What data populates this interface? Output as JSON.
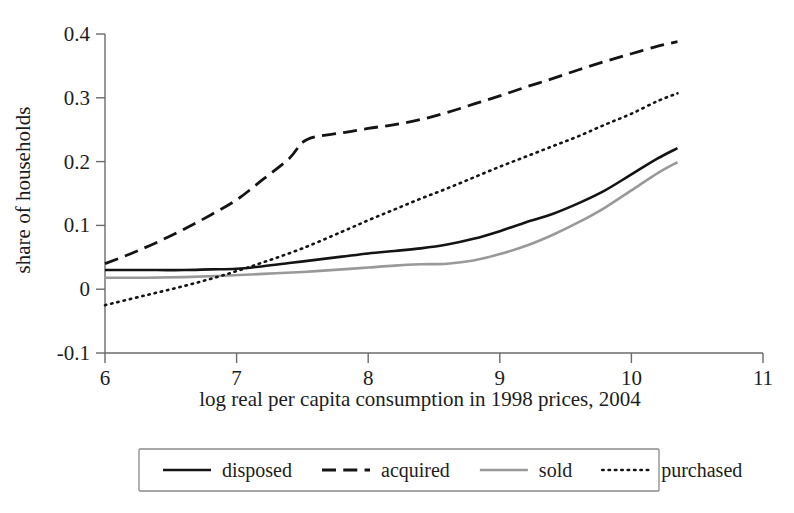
{
  "chart_data": {
    "type": "line",
    "title": "",
    "xlabel": "log real per capita consumption in 1998 prices, 2004",
    "ylabel": "share of households",
    "xlim": [
      6,
      11
    ],
    "ylim": [
      -0.1,
      0.4
    ],
    "xticks": [
      "6",
      "7",
      "8",
      "9",
      "10",
      "11"
    ],
    "yticks": [
      "0.4",
      "0.3",
      "0.2",
      "0.1",
      "0",
      "-0.1"
    ],
    "xtick_values": [
      6,
      7,
      8,
      9,
      10,
      11
    ],
    "ytick_values": [
      0.4,
      0.3,
      0.2,
      0.1,
      0,
      -0.1
    ],
    "grid": false,
    "legend_position": "below-axes",
    "series": [
      {
        "name": "disposed",
        "style": "solid",
        "color": "#141414",
        "width": 2.6,
        "points": [
          [
            6.0,
            0.03
          ],
          [
            6.2,
            0.03
          ],
          [
            6.4,
            0.03
          ],
          [
            6.6,
            0.03
          ],
          [
            6.8,
            0.031
          ],
          [
            7.0,
            0.032
          ],
          [
            7.2,
            0.036
          ],
          [
            7.4,
            0.041
          ],
          [
            7.6,
            0.046
          ],
          [
            7.8,
            0.051
          ],
          [
            8.0,
            0.056
          ],
          [
            8.2,
            0.06
          ],
          [
            8.4,
            0.064
          ],
          [
            8.6,
            0.07
          ],
          [
            8.8,
            0.079
          ],
          [
            9.0,
            0.091
          ],
          [
            9.2,
            0.105
          ],
          [
            9.4,
            0.118
          ],
          [
            9.6,
            0.135
          ],
          [
            9.8,
            0.155
          ],
          [
            10.0,
            0.18
          ],
          [
            10.2,
            0.205
          ],
          [
            10.35,
            0.221
          ]
        ]
      },
      {
        "name": "acquired",
        "style": "dashed",
        "color": "#141414",
        "width": 2.8,
        "points": [
          [
            6.0,
            0.04
          ],
          [
            6.2,
            0.056
          ],
          [
            6.4,
            0.074
          ],
          [
            6.6,
            0.094
          ],
          [
            6.8,
            0.116
          ],
          [
            7.0,
            0.14
          ],
          [
            7.2,
            0.172
          ],
          [
            7.4,
            0.205
          ],
          [
            7.5,
            0.23
          ],
          [
            7.6,
            0.239
          ],
          [
            7.8,
            0.245
          ],
          [
            8.0,
            0.252
          ],
          [
            8.2,
            0.258
          ],
          [
            8.4,
            0.266
          ],
          [
            8.6,
            0.277
          ],
          [
            8.8,
            0.29
          ],
          [
            9.0,
            0.303
          ],
          [
            9.2,
            0.317
          ],
          [
            9.4,
            0.33
          ],
          [
            9.6,
            0.344
          ],
          [
            9.8,
            0.357
          ],
          [
            10.0,
            0.369
          ],
          [
            10.2,
            0.381
          ],
          [
            10.35,
            0.388
          ]
        ]
      },
      {
        "name": "sold",
        "style": "solid",
        "color": "#999999",
        "width": 2.6,
        "points": [
          [
            6.0,
            0.018
          ],
          [
            6.3,
            0.018
          ],
          [
            6.6,
            0.019
          ],
          [
            6.9,
            0.021
          ],
          [
            7.2,
            0.024
          ],
          [
            7.5,
            0.027
          ],
          [
            7.8,
            0.031
          ],
          [
            8.0,
            0.034
          ],
          [
            8.2,
            0.037
          ],
          [
            8.4,
            0.039
          ],
          [
            8.6,
            0.04
          ],
          [
            8.8,
            0.045
          ],
          [
            9.0,
            0.055
          ],
          [
            9.2,
            0.068
          ],
          [
            9.4,
            0.085
          ],
          [
            9.6,
            0.105
          ],
          [
            9.8,
            0.128
          ],
          [
            10.0,
            0.155
          ],
          [
            10.2,
            0.182
          ],
          [
            10.35,
            0.199
          ]
        ]
      },
      {
        "name": "purchased",
        "style": "dotted",
        "color": "#141414",
        "width": 2.6,
        "points": [
          [
            6.0,
            -0.025
          ],
          [
            6.3,
            -0.01
          ],
          [
            6.6,
            0.005
          ],
          [
            6.9,
            0.022
          ],
          [
            7.2,
            0.042
          ],
          [
            7.5,
            0.064
          ],
          [
            7.8,
            0.09
          ],
          [
            8.0,
            0.108
          ],
          [
            8.2,
            0.125
          ],
          [
            8.4,
            0.142
          ],
          [
            8.6,
            0.158
          ],
          [
            8.8,
            0.175
          ],
          [
            9.0,
            0.192
          ],
          [
            9.2,
            0.208
          ],
          [
            9.4,
            0.224
          ],
          [
            9.6,
            0.24
          ],
          [
            9.8,
            0.258
          ],
          [
            10.0,
            0.275
          ],
          [
            10.2,
            0.295
          ],
          [
            10.35,
            0.307
          ]
        ]
      }
    ]
  },
  "legend": {
    "items": [
      {
        "label": "disposed",
        "style": "solid",
        "color": "#141414"
      },
      {
        "label": "acquired",
        "style": "dashed",
        "color": "#141414"
      },
      {
        "label": "sold",
        "style": "solid",
        "color": "#999999"
      },
      {
        "label": "purchased",
        "style": "dotted",
        "color": "#141414"
      }
    ]
  }
}
